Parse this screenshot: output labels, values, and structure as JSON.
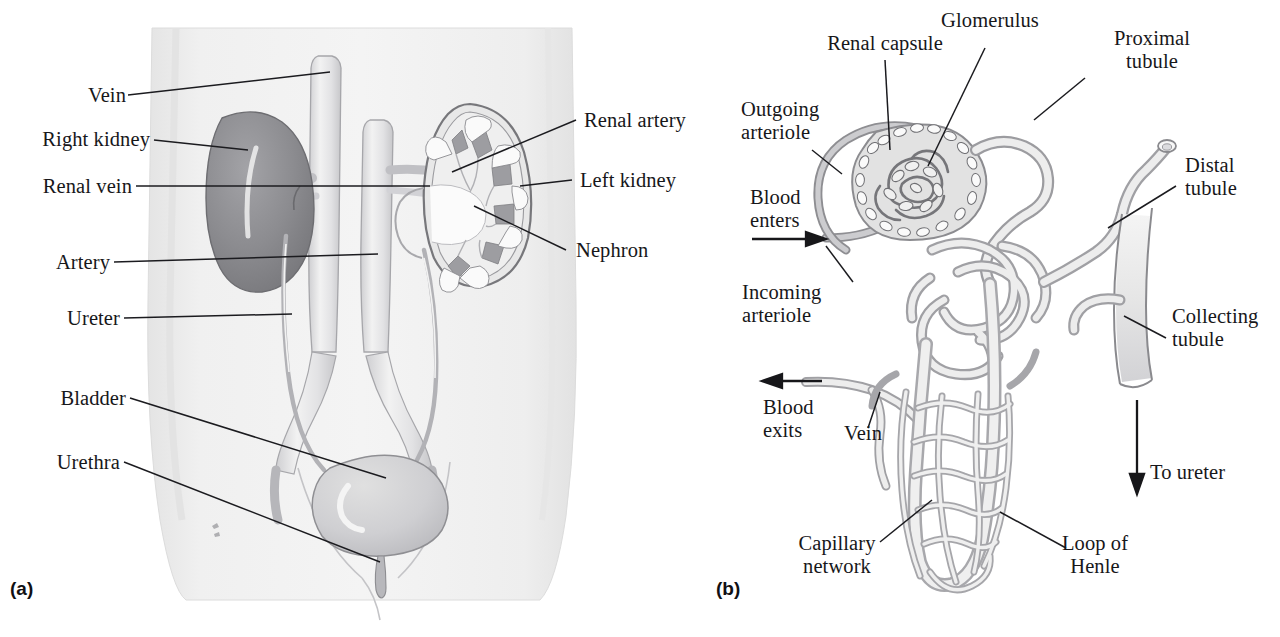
{
  "figure": {
    "panels": [
      {
        "id": "a",
        "label": "(a)",
        "caption": "Urinary system in the body"
      },
      {
        "id": "b",
        "label": "(b)",
        "caption": "Nephron with blood supply"
      }
    ]
  },
  "panel_a": {
    "label": "(a)",
    "labels": [
      {
        "key": "vein",
        "text": "Vein"
      },
      {
        "key": "right_kidney",
        "text": "Right kidney"
      },
      {
        "key": "renal_vein",
        "text": "Renal vein"
      },
      {
        "key": "artery",
        "text": "Artery"
      },
      {
        "key": "ureter",
        "text": "Ureter"
      },
      {
        "key": "bladder",
        "text": "Bladder"
      },
      {
        "key": "urethra",
        "text": "Urethra"
      },
      {
        "key": "renal_artery",
        "text": "Renal artery"
      },
      {
        "key": "left_kidney",
        "text": "Left kidney"
      },
      {
        "key": "nephron",
        "text": "Nephron"
      }
    ]
  },
  "panel_b": {
    "label": "(b)",
    "labels": [
      {
        "key": "renal_capsule",
        "text": "Renal capsule"
      },
      {
        "key": "glomerulus",
        "text": "Glomerulus"
      },
      {
        "key": "proximal_tubule",
        "line1": "Proximal",
        "line2": "tubule"
      },
      {
        "key": "outgoing_arteriole",
        "line1": "Outgoing",
        "line2": "arteriole"
      },
      {
        "key": "blood_enters",
        "line1": "Blood",
        "line2": "enters"
      },
      {
        "key": "incoming_arteriole",
        "line1": "Incoming",
        "line2": "arteriole"
      },
      {
        "key": "distal_tubule",
        "line1": "Distal",
        "line2": "tubule"
      },
      {
        "key": "collecting_tubule",
        "line1": "Collecting",
        "line2": "tubule"
      },
      {
        "key": "blood_exits",
        "line1": "Blood",
        "line2": "exits"
      },
      {
        "key": "vein",
        "text": "Vein"
      },
      {
        "key": "to_ureter",
        "text": "To ureter"
      },
      {
        "key": "capillary_network",
        "line1": "Capillary",
        "line2": "network"
      },
      {
        "key": "loop_of_henle",
        "line1": "Loop of",
        "line2": "Henle"
      }
    ]
  },
  "colors": {
    "background": "#ffffff",
    "text": "#17171a",
    "leader_line": "#1b1b1f",
    "torso_fill": "#efefef",
    "torso_edge": "#d9d9d9",
    "kidney_dark": "#8b8b8f",
    "kidney_dark_edge": "#6a6a6e",
    "kidney_light": "#e3e3e3",
    "vessel_light": "#ededed",
    "vessel_edge": "#9a9a9e",
    "pyramid": "#9d9da1",
    "tubule_fill": "#ededed",
    "tubule_edge": "#a7a7ab",
    "capsule_fill": "#e0e0e0",
    "arteriole_fill": "#c9c9cd"
  }
}
